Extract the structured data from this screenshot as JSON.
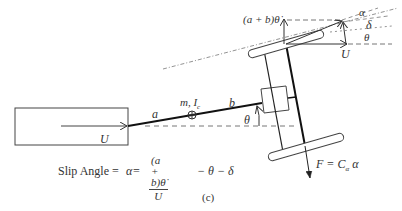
{
  "diagram": {
    "caption": "(c)",
    "labels": {
      "velocity_U_left": "U",
      "segment_a": "a",
      "segment_b": "b",
      "mass_inertia": "m, I",
      "mass_inertia_sub": "c",
      "angle_theta_body": "θ",
      "lateral_velocity": "(a + b)θ̇",
      "angle_alpha": "α",
      "angle_delta": "δ",
      "angle_theta_top": "θ",
      "velocity_U_right": "U",
      "force": "F = C",
      "force_sub": "α",
      "force_tail": " α"
    },
    "formula": {
      "prefix": "Slip Angle = ",
      "alpha": "α",
      "eq": " = ",
      "numerator": "(a + b)θ̇",
      "denominator": "U",
      "suffix": " − θ − δ"
    },
    "colors": {
      "line": "#333333",
      "thick_line": "#111111",
      "dashed": "#666666",
      "background": "#ffffff"
    }
  }
}
